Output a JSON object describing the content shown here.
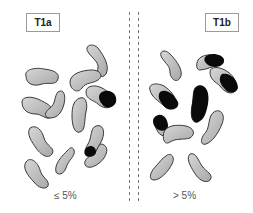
{
  "panels": {
    "left": {
      "label": "T1a",
      "caption": "≤ 5%"
    },
    "right": {
      "label": "T1b",
      "caption": "> 5%"
    }
  },
  "colors": {
    "cell_fill": "#bdbdbd",
    "cell_stroke": "#3a3a3a",
    "tumor_fill": "#0a0a0a",
    "divider": "#777777"
  }
}
